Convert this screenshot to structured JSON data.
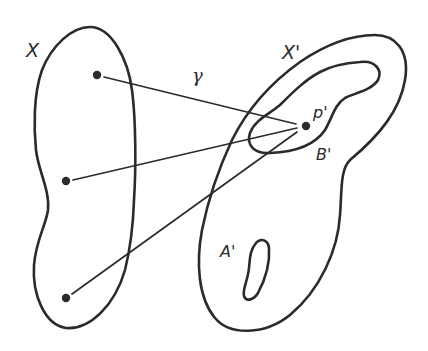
{
  "diagram": {
    "type": "set-mapping illustration",
    "colors": {
      "stroke": "#2b2b2b",
      "background": "#ffffff"
    },
    "labels": {
      "X": "X",
      "X_prime": "X'",
      "gamma": "γ",
      "p_prime": "p'",
      "B_prime": "B'",
      "A_prime": "A'"
    },
    "regions": [
      {
        "id": "X",
        "description": "elongated closed region on the left containing three points"
      },
      {
        "id": "X_prime",
        "description": "large closed region on the right"
      },
      {
        "id": "B_prime",
        "description": "inner closed region inside X' containing p'"
      },
      {
        "id": "A_prime",
        "description": "small closed blob inside X' near its lower-left"
      }
    ],
    "points": [
      {
        "id": "x1",
        "region": "X",
        "x": 97,
        "y": 75
      },
      {
        "id": "x2",
        "region": "X",
        "x": 66,
        "y": 181
      },
      {
        "id": "x3",
        "region": "X",
        "x": 66,
        "y": 298
      },
      {
        "id": "p_prime",
        "region": "B_prime",
        "x": 306,
        "y": 126
      }
    ],
    "edges": [
      {
        "from": "x1",
        "to": "p_prime",
        "label": "γ"
      },
      {
        "from": "x2",
        "to": "p_prime"
      },
      {
        "from": "x3",
        "to": "p_prime"
      }
    ]
  }
}
